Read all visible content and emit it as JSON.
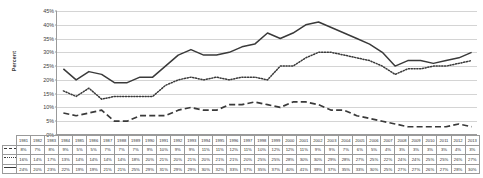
{
  "axis": {
    "ylabel": "Percent",
    "yticks": [
      "0%",
      "5%",
      "10%",
      "15%",
      "20%",
      "25%",
      "30%",
      "35%",
      "40%",
      "45%"
    ]
  },
  "legend": [
    {
      "label": "Aggravated",
      "style": "dashed",
      "marker": "dashed-line-swatch"
    },
    {
      "label": "Mitigated",
      "style": "dotted",
      "marker": "dotted-line-swatch"
    },
    {
      "label": "Overall",
      "style": "solid",
      "marker": "solid-line-swatch"
    }
  ],
  "chart_data": {
    "type": "line",
    "title": "",
    "xlabel": "",
    "ylabel": "Percent",
    "ylim": [
      0,
      45
    ],
    "ytick_step": 5,
    "grid": true,
    "legend_position": "table-left",
    "categories": [
      "1981",
      "1982",
      "1983",
      "1984",
      "1985",
      "1986",
      "1987",
      "1988",
      "1989",
      "1990",
      "1991",
      "1992",
      "1993",
      "1994",
      "1995",
      "1996",
      "1997",
      "1998",
      "1999",
      "2000",
      "2001",
      "2002",
      "2003",
      "2004",
      "2005",
      "2006",
      "2007",
      "2008",
      "2009",
      "2010",
      "2011",
      "2012",
      "2013"
    ],
    "series": [
      {
        "name": "Aggravated",
        "style": "dashed",
        "values": [
          8,
          7,
          8,
          9,
          5,
          5,
          7,
          7,
          7,
          9,
          10,
          9,
          9,
          11,
          11,
          12,
          11,
          10,
          12,
          12,
          11,
          9,
          9,
          7,
          6,
          5,
          4,
          3,
          3,
          3,
          3,
          4,
          3
        ]
      },
      {
        "name": "Mitigated",
        "style": "dotted",
        "values": [
          16,
          14,
          17,
          13,
          14,
          14,
          14,
          14,
          18,
          20,
          21,
          20,
          21,
          20,
          21,
          21,
          20,
          25,
          25,
          28,
          30,
          30,
          29,
          28,
          27,
          25,
          22,
          24,
          24,
          25,
          25,
          26,
          27
        ]
      },
      {
        "name": "Overall",
        "style": "solid",
        "values": [
          24,
          20,
          23,
          22,
          19,
          19,
          21,
          21,
          25,
          29,
          31,
          29,
          29,
          30,
          32,
          33,
          37,
          35,
          37,
          40,
          41,
          39,
          37,
          35,
          33,
          30,
          25,
          27,
          27,
          26,
          27,
          28,
          30
        ]
      }
    ]
  }
}
